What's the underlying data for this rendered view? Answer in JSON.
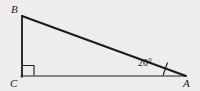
{
  "figure": {
    "type": "right-triangle-diagram",
    "background_color": "#eeecec",
    "stroke_color": "#1b1b1b",
    "vertices": {
      "B": {
        "label": "B",
        "x": 22,
        "y": 16
      },
      "C": {
        "label": "C",
        "x": 22,
        "y": 76
      },
      "A": {
        "label": "A",
        "x": 186,
        "y": 76
      }
    },
    "angles": {
      "at_A": {
        "value": "20°",
        "measure": 20,
        "unit": "degrees"
      },
      "at_C": {
        "value": "90°",
        "measure": 90,
        "unit": "degrees",
        "marker": "right-angle-square"
      }
    },
    "sides": [
      {
        "name": "BC",
        "from": "B",
        "to": "C",
        "orientation": "vertical"
      },
      {
        "name": "CA",
        "from": "C",
        "to": "A",
        "orientation": "horizontal"
      },
      {
        "name": "BA",
        "from": "B",
        "to": "A",
        "orientation": "hypotenuse"
      }
    ]
  }
}
